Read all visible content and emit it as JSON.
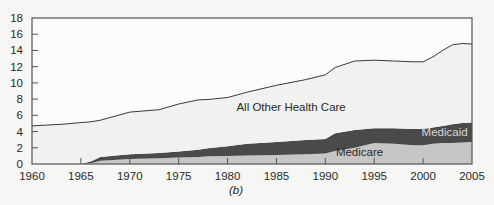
{
  "chart_data": {
    "type": "area",
    "stacked": true,
    "title": "",
    "caption": "(b)",
    "xlabel": "",
    "ylabel": "",
    "xlim": [
      1960,
      2005
    ],
    "ylim": [
      0,
      18
    ],
    "x_ticks": [
      1960,
      1965,
      1970,
      1975,
      1980,
      1985,
      1990,
      1995,
      2000,
      2005
    ],
    "y_ticks": [
      0,
      2,
      4,
      6,
      8,
      10,
      12,
      14,
      16,
      18
    ],
    "grid": false,
    "legend": "inline labels",
    "x": [
      1960,
      1963,
      1965,
      1966,
      1967,
      1970,
      1973,
      1975,
      1977,
      1978,
      1980,
      1982,
      1985,
      1988,
      1990,
      1991,
      1993,
      1995,
      1997,
      1999,
      2000,
      2001,
      2002,
      2003,
      2004,
      2005
    ],
    "series": [
      {
        "name": "Medicare",
        "color": "#c6c6c4",
        "label_pos": {
          "x": 1993.5,
          "y": 1.0
        },
        "values": [
          0,
          0,
          0,
          0.1,
          0.4,
          0.6,
          0.7,
          0.8,
          0.85,
          0.95,
          1.0,
          1.05,
          1.1,
          1.2,
          1.3,
          1.6,
          2.0,
          2.6,
          2.5,
          2.3,
          2.3,
          2.5,
          2.6,
          2.6,
          2.65,
          2.7
        ]
      },
      {
        "name": "Medicaid",
        "color": "#4a4a4a",
        "label_pos": {
          "x": 2002.2,
          "y": 3.5
        },
        "values": [
          0,
          0,
          0,
          0.2,
          0.45,
          0.6,
          0.65,
          0.75,
          0.9,
          1.0,
          1.2,
          1.45,
          1.6,
          1.75,
          1.8,
          2.2,
          2.2,
          1.8,
          1.9,
          2.0,
          2.0,
          2.0,
          2.1,
          2.3,
          2.4,
          2.4
        ]
      },
      {
        "name": "All Other Health Care",
        "color": "#f1f1ef",
        "label_pos": {
          "x": 1986.5,
          "y": 6.5
        },
        "values": [
          4.7,
          4.9,
          5.1,
          4.9,
          4.55,
          5.2,
          5.35,
          5.85,
          6.15,
          6.0,
          6.0,
          6.35,
          7.0,
          7.45,
          7.9,
          8.1,
          8.5,
          8.4,
          8.3,
          8.3,
          8.3,
          8.7,
          9.3,
          9.8,
          9.8,
          9.7
        ]
      }
    ],
    "totals": [
      4.7,
      4.9,
      5.1,
      5.2,
      5.4,
      6.4,
      6.7,
      7.4,
      7.9,
      7.95,
      8.2,
      8.85,
      9.7,
      10.4,
      11.0,
      11.9,
      12.7,
      12.8,
      12.7,
      12.6,
      12.6,
      13.2,
      14.0,
      14.7,
      14.85,
      14.8
    ]
  }
}
